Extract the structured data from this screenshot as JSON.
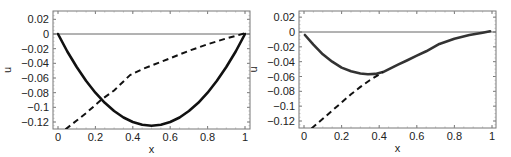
{
  "chart_data": [
    {
      "type": "line",
      "title": "",
      "xlabel": "x",
      "ylabel": "u",
      "xlim": [
        -0.025,
        1.025
      ],
      "ylim": [
        -0.13,
        0.03
      ],
      "xticks": [
        0,
        0.2,
        0.4,
        0.6,
        0.8,
        1
      ],
      "xtick_labels": [
        "0",
        "0.2",
        "0.4",
        "0.6",
        "0.8",
        "1"
      ],
      "yticks": [
        0.02,
        0,
        -0.02,
        -0.04,
        -0.06,
        -0.08,
        -0.1,
        -0.12
      ],
      "ytick_labels": [
        "0.02",
        "0",
        "−0.02",
        "−0.04",
        "−0.06",
        "−0.08",
        "−0.1",
        "−0.12"
      ],
      "grid": false,
      "reference_line": {
        "y": 0
      },
      "series": [
        {
          "name": "solid",
          "style": "solid",
          "color": "#111111",
          "x": [
            0,
            0.05,
            0.1,
            0.15,
            0.2,
            0.25,
            0.3,
            0.35,
            0.4,
            0.45,
            0.5,
            0.55,
            0.6,
            0.65,
            0.7,
            0.75,
            0.8,
            0.85,
            0.9,
            0.95,
            1
          ],
          "y": [
            0,
            -0.0238,
            -0.045,
            -0.0638,
            -0.08,
            -0.0938,
            -0.105,
            -0.1138,
            -0.12,
            -0.1238,
            -0.125,
            -0.1238,
            -0.12,
            -0.1138,
            -0.105,
            -0.0938,
            -0.08,
            -0.0638,
            -0.045,
            -0.0238,
            0
          ]
        },
        {
          "name": "dashed",
          "style": "dashed",
          "color": "#111111",
          "x": [
            0.04,
            0.1,
            0.15,
            0.235,
            0.3,
            0.385,
            0.45,
            0.55,
            0.65,
            0.71,
            0.8,
            0.9,
            1
          ],
          "y": [
            -0.13,
            -0.118,
            -0.108,
            -0.089,
            -0.077,
            -0.056,
            -0.048,
            -0.038,
            -0.028,
            -0.022,
            -0.014,
            -0.006,
            0.001
          ]
        }
      ]
    },
    {
      "type": "line",
      "title": "",
      "xlabel": "x",
      "ylabel": "u",
      "xlim": [
        -0.025,
        1.025
      ],
      "ylim": [
        -0.13,
        0.03
      ],
      "xticks": [
        0,
        0.2,
        0.4,
        0.6,
        0.8,
        1
      ],
      "xtick_labels": [
        "0",
        "0.2",
        "0.4",
        "0.6",
        "0.8",
        "1"
      ],
      "yticks": [
        0.02,
        0,
        -0.02,
        -0.04,
        -0.06,
        -0.08,
        -0.1,
        -0.12
      ],
      "ytick_labels": [
        "0.02",
        "0",
        "−0.02",
        "−0.04",
        "−0.06",
        "−0.08",
        "−0.1",
        "−0.12"
      ],
      "grid": false,
      "reference_line": {
        "y": 0
      },
      "series": [
        {
          "name": "solid",
          "style": "solid",
          "color": "#333333",
          "x": [
            0.005,
            0.05,
            0.1,
            0.15,
            0.2,
            0.25,
            0.3,
            0.34,
            0.38,
            0.42,
            0.46,
            0.5,
            0.55,
            0.6,
            0.65,
            0.72,
            0.8,
            0.88,
            0.95,
            0.99
          ],
          "y": [
            -0.004,
            -0.017,
            -0.03,
            -0.04,
            -0.048,
            -0.053,
            -0.056,
            -0.057,
            -0.0565,
            -0.054,
            -0.049,
            -0.044,
            -0.038,
            -0.032,
            -0.026,
            -0.016,
            -0.009,
            -0.004,
            -0.001,
            0.001
          ]
        },
        {
          "name": "dashed",
          "style": "dashed",
          "color": "#111111",
          "x": [
            0.04,
            0.1,
            0.15,
            0.2,
            0.25,
            0.3,
            0.35,
            0.42
          ],
          "y": [
            -0.13,
            -0.117,
            -0.106,
            -0.095,
            -0.084,
            -0.074,
            -0.065,
            -0.054
          ]
        }
      ]
    }
  ],
  "panels": [
    {
      "frame": {
        "left": 53,
        "top": 11,
        "right": 250,
        "bottom": 129
      },
      "x0px": 58,
      "x1px": 245,
      "y0px": 34,
      "ym012px": 122
    },
    {
      "frame": {
        "left": 299,
        "top": 11,
        "right": 496,
        "bottom": 128
      },
      "x0px": 304,
      "x1px": 492,
      "y0px": 32,
      "ym012px": 121
    }
  ]
}
